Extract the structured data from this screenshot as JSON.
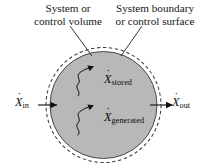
{
  "figure": {
    "background_color": "#ffffff",
    "body_fill_color": "#b8b8b8",
    "boundary_color": "#3c3c3c",
    "text_color": "#171717"
  },
  "callouts": {
    "left": {
      "line1": "System or",
      "line2": "control volume",
      "points_to": "control-volume-body"
    },
    "right": {
      "line1": "System boundary",
      "line2": "or control surface",
      "points_to": "system-boundary-dashed-ring"
    }
  },
  "flows": {
    "inlet": {
      "symbol": "X",
      "dot": "˙",
      "subscript": "in",
      "direction": "right"
    },
    "outlet": {
      "symbol": "X",
      "dot": "˙",
      "subscript": "out",
      "direction": "right"
    }
  },
  "internal_terms": [
    {
      "symbol": "X",
      "dot": "˙",
      "subscript": "stored",
      "arrow_style": "wavy"
    },
    {
      "symbol": "X",
      "dot": "˙",
      "subscript": "generated",
      "arrow_style": "wavy"
    }
  ]
}
